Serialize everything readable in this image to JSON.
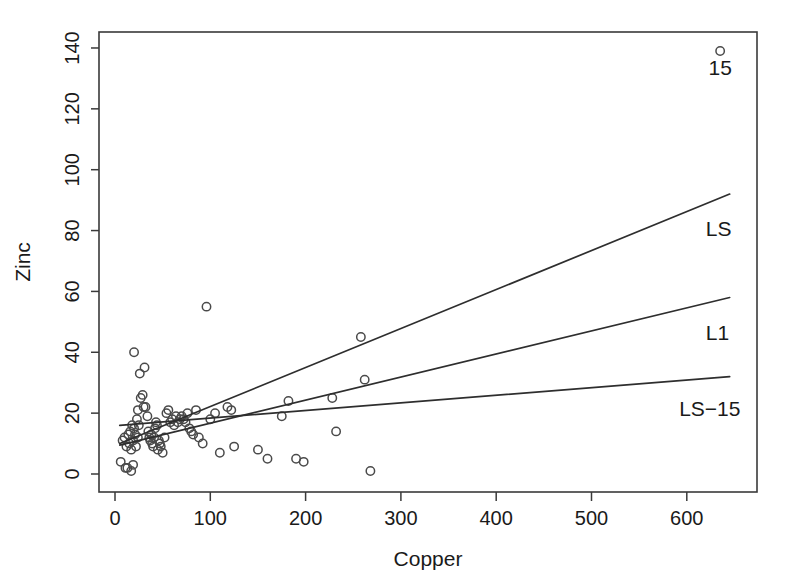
{
  "chart_data": {
    "type": "scatter",
    "title": "",
    "xlabel": "Copper",
    "ylabel": "Zinc",
    "xlim": [
      -10,
      675
    ],
    "ylim": [
      -6,
      147
    ],
    "grid": false,
    "legend_position": "inline-right",
    "xticks": [
      0,
      100,
      200,
      300,
      400,
      500,
      600
    ],
    "xtick_labels": [
      "0",
      "100",
      "200",
      "300",
      "400",
      "500",
      "600"
    ],
    "yticks": [
      0,
      20,
      40,
      60,
      80,
      100,
      120,
      140
    ],
    "ytick_labels": [
      "0",
      "20",
      "40",
      "60",
      "80",
      "100",
      "120",
      "140"
    ],
    "points": [
      [
        6,
        4
      ],
      [
        11,
        2
      ],
      [
        13,
        2
      ],
      [
        17,
        1
      ],
      [
        19,
        3
      ],
      [
        8,
        11
      ],
      [
        10,
        12
      ],
      [
        12,
        9
      ],
      [
        14,
        13
      ],
      [
        15,
        10
      ],
      [
        16,
        14
      ],
      [
        17,
        8
      ],
      [
        18,
        16
      ],
      [
        19,
        11
      ],
      [
        20,
        15
      ],
      [
        21,
        13
      ],
      [
        22,
        9
      ],
      [
        23,
        18
      ],
      [
        24,
        12
      ],
      [
        25,
        16
      ],
      [
        20,
        40
      ],
      [
        26,
        33
      ],
      [
        31,
        35
      ],
      [
        27,
        25
      ],
      [
        29,
        26
      ],
      [
        30,
        22
      ],
      [
        32,
        22
      ],
      [
        24,
        21
      ],
      [
        34,
        19
      ],
      [
        35,
        14
      ],
      [
        36,
        12
      ],
      [
        37,
        11
      ],
      [
        38,
        13
      ],
      [
        39,
        10
      ],
      [
        40,
        9
      ],
      [
        41,
        12
      ],
      [
        42,
        15
      ],
      [
        43,
        17
      ],
      [
        44,
        16
      ],
      [
        45,
        8
      ],
      [
        46,
        11
      ],
      [
        47,
        10
      ],
      [
        48,
        9
      ],
      [
        50,
        7
      ],
      [
        52,
        12
      ],
      [
        54,
        20
      ],
      [
        56,
        21
      ],
      [
        58,
        17
      ],
      [
        60,
        18
      ],
      [
        62,
        16
      ],
      [
        64,
        19
      ],
      [
        66,
        17
      ],
      [
        68,
        18
      ],
      [
        70,
        19
      ],
      [
        72,
        18
      ],
      [
        74,
        17
      ],
      [
        76,
        20
      ],
      [
        78,
        15
      ],
      [
        80,
        14
      ],
      [
        82,
        13
      ],
      [
        85,
        21
      ],
      [
        88,
        12
      ],
      [
        92,
        10
      ],
      [
        96,
        55
      ],
      [
        100,
        18
      ],
      [
        105,
        20
      ],
      [
        110,
        7
      ],
      [
        118,
        22
      ],
      [
        122,
        21
      ],
      [
        125,
        9
      ],
      [
        150,
        8
      ],
      [
        160,
        5
      ],
      [
        175,
        19
      ],
      [
        182,
        24
      ],
      [
        190,
        5
      ],
      [
        198,
        4
      ],
      [
        228,
        25
      ],
      [
        232,
        14
      ],
      [
        258,
        45
      ],
      [
        262,
        31
      ],
      [
        268,
        1
      ],
      [
        635,
        139
      ]
    ],
    "annotated_points": [
      {
        "label": "15",
        "x": 635,
        "y": 139
      }
    ],
    "series": [
      {
        "name": "LS",
        "type": "line",
        "label": "LS",
        "x": [
          5,
          645
        ],
        "y": [
          10.0,
          92.0
        ],
        "label_x": 620,
        "label_y": 80
      },
      {
        "name": "L1",
        "type": "line",
        "label": "L1",
        "x": [
          5,
          645
        ],
        "y": [
          9.5,
          58.0
        ],
        "label_x": 620,
        "label_y": 46
      },
      {
        "name": "LS-15",
        "type": "line",
        "label": "LS−15",
        "x": [
          5,
          645
        ],
        "y": [
          16.0,
          32.0
        ],
        "label_x": 592,
        "label_y": 21
      }
    ]
  },
  "axes": {
    "x_title": "Copper",
    "y_title": "Zinc"
  }
}
